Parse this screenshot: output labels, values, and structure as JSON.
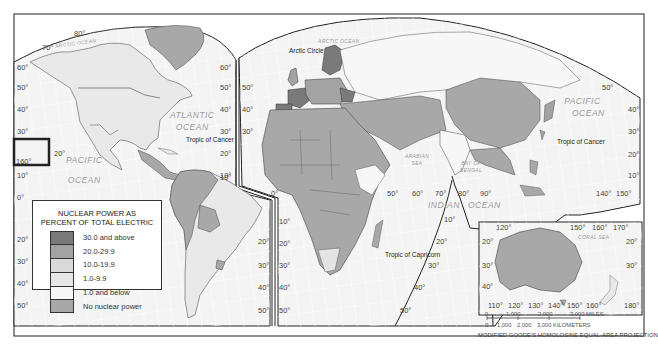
{
  "map": {
    "title": "Nuclear Power as Percent of Total Electric",
    "projection": "MODIFIED GOODE'S HOMOLOSINE EQUAL-AREA PROJECTION",
    "colors": {
      "ocean": "#f4f4f4",
      "grid": "#ffffff",
      "border": "#333333",
      "no_nuclear": "#a8a8a8",
      "below_1": "#f2f2f2",
      "1_to_9_9": "#e4e4e4",
      "10_to_19_9": "#d2d2d2",
      "20_to_29_9": "#a3a3a3",
      "30_above": "#7a7a7a"
    }
  },
  "legend": {
    "title_line1": "NUCLEAR POWER AS",
    "title_line2": "PERCENT OF TOTAL ELECTRIC",
    "items": [
      {
        "label": "30.0 and above",
        "color": "#7a7a7a"
      },
      {
        "label": "20.0-29.9",
        "color": "#a3a3a3"
      },
      {
        "label": "10.0-19.9",
        "color": "#dadada"
      },
      {
        "label": "1.0-9.9",
        "color": "#e6e6e6"
      },
      {
        "label": "1.0 and below",
        "color": "#f7f7f7"
      },
      {
        "label": "No nuclear power",
        "color": "#a8a8a8"
      }
    ]
  },
  "oceans": {
    "arctic_left": "ARCTIC OCEAN",
    "arctic_right": "ARCTIC OCEAN",
    "atlantic_1": "ATLANTIC",
    "atlantic_2": "OCEAN",
    "pacific_left_1": "PACIFIC",
    "pacific_left_2": "OCEAN",
    "pacific_right_1": "PACIFIC",
    "pacific_right_2": "OCEAN",
    "indian_1": "INDIAN",
    "indian_2": "OCEAN",
    "arabian_1": "ARABIAN",
    "arabian_2": "SEA",
    "bengal_1": "BAY OF",
    "bengal_2": "BENGAL",
    "coral": "CORAL SEA"
  },
  "notes": {
    "arctic_circle": "Arctic Circle",
    "tropic_cancer_left": "Tropic of Cancer",
    "tropic_cancer_right": "Tropic of Cancer",
    "tropic_capricorn": "Tropic of Capricorn"
  },
  "latitude_labels": {
    "left_edge": [
      "60°",
      "50°",
      "40°",
      "30°",
      "10°",
      "0°",
      "20°",
      "30°",
      "40°",
      "50°"
    ],
    "mid_left": [
      "60°",
      "50°",
      "40°",
      "30°",
      "20°",
      "10°"
    ],
    "mid_right": [
      "50°",
      "40°",
      "30°"
    ],
    "sa_right": [
      "20°",
      "30°",
      "40°",
      "50°"
    ],
    "africa_left": [
      "10°",
      "20°",
      "30°",
      "40°",
      "50°"
    ],
    "sa_inner": [
      "10°",
      "20°",
      "30°",
      "40°",
      "50°"
    ],
    "indian_ocean": [
      "10°",
      "20°",
      "30°",
      "40°",
      "50°"
    ],
    "pacific_right": [
      "50°",
      "40°",
      "30°",
      "20°",
      "10°"
    ]
  },
  "longitude_labels": {
    "top_left": [
      "80°",
      "70°"
    ],
    "hawaii": "160°",
    "hawaii_lat": "20°",
    "equator_zero": "0°",
    "equator_row": [
      "50°",
      "60°",
      "70°",
      "80°",
      "90°"
    ],
    "pacific_right": [
      "140°",
      "150°"
    ]
  },
  "inset_australia": {
    "top": [
      "120°",
      "150°",
      "160°",
      "170°"
    ],
    "left": [
      "20°",
      "30°",
      "40°"
    ],
    "right": [
      "20°",
      "30°"
    ],
    "bottom": [
      "110°",
      "120°",
      "130°",
      "140°",
      "150°",
      "160°",
      "180°"
    ]
  },
  "scale": {
    "miles_ticks": [
      "0",
      "1,000",
      "2,000",
      "3,000 MILES"
    ],
    "km_ticks": [
      "0",
      "1,000",
      "2,000",
      "3,000 KILOMETERS"
    ]
  }
}
